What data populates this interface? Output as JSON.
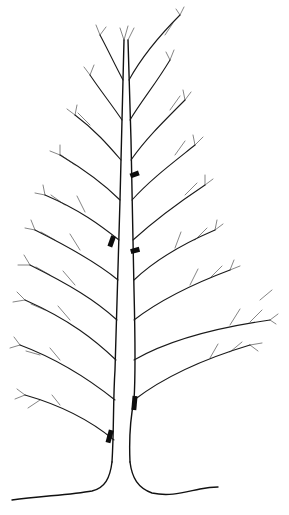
{
  "illustration": {
    "subject": "Line drawing of a deciduous tree with branch markers",
    "background_color": "#ffffff",
    "line_color": "#111111",
    "marker_color": "#0d0d0d",
    "markers": [
      {
        "id": 1,
        "x": 135,
        "y": 177,
        "angle": -20
      },
      {
        "id": 2,
        "x": 112,
        "y": 242,
        "angle": 20
      },
      {
        "id": 3,
        "x": 135,
        "y": 252,
        "angle": -15
      },
      {
        "id": 4,
        "x": 134,
        "y": 402,
        "angle": 5
      },
      {
        "id": 5,
        "x": 110,
        "y": 437,
        "angle": 15
      }
    ]
  }
}
